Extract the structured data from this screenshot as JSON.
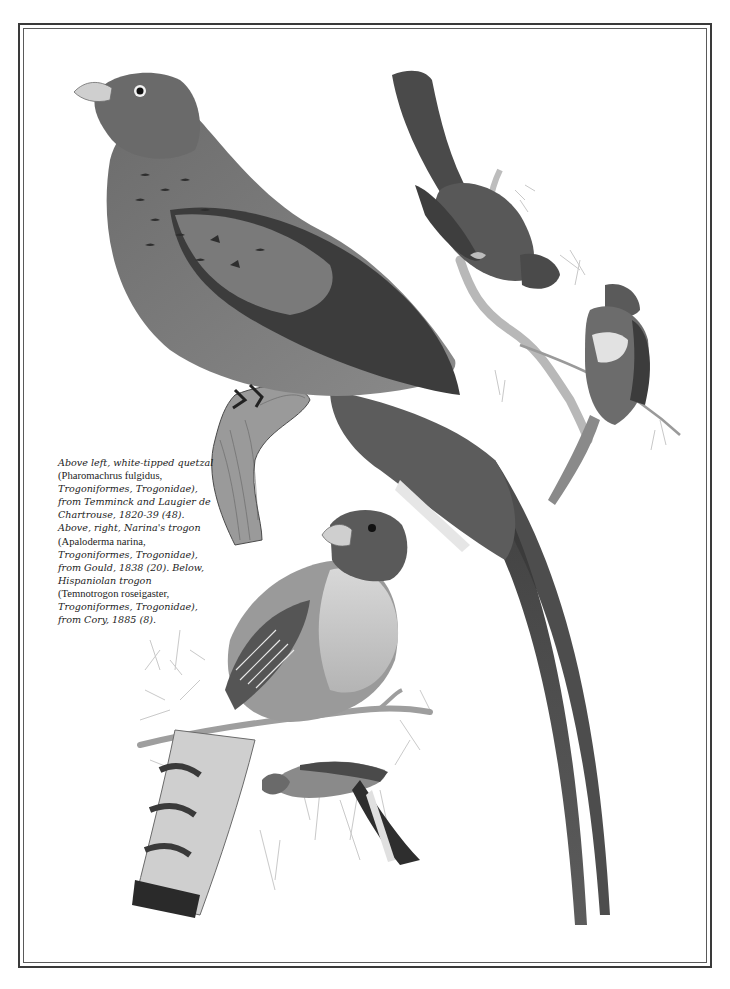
{
  "page": {
    "background": "#ffffff",
    "frame_color": "#3a3a3a"
  },
  "illustrations": [
    {
      "name": "white-tipped quetzal",
      "position": "above left",
      "tone": "#7a7a7a"
    },
    {
      "name": "Narina's trogon (pair)",
      "position": "above right",
      "tone": "#6e6e6e"
    },
    {
      "name": "Hispaniolan trogon (pair)",
      "position": "below",
      "tone": "#8a8a8a"
    }
  ],
  "caption": {
    "lines": [
      {
        "text": "Above left, white-tipped quetzal",
        "style": "it"
      },
      {
        "text": "(Pharomachrus fulgidus,",
        "style": "rm"
      },
      {
        "text": "Trogoniformes, Trogonidae),",
        "style": "it"
      },
      {
        "text": "from Temminck and Laugier de",
        "style": "it"
      },
      {
        "text": "Chartrouse, 1820-39 (48).",
        "style": "it"
      },
      {
        "text": "Above, right, Narina's trogon",
        "style": "it"
      },
      {
        "text": "(Apaloderma narina,",
        "style": "rm"
      },
      {
        "text": "Trogoniformes, Trogonidae),",
        "style": "it"
      },
      {
        "text": "from Gould, 1838 (20). Below,",
        "style": "it"
      },
      {
        "text": "Hispaniolan trogon",
        "style": "it"
      },
      {
        "text": "(Temnotrogon roseigaster,",
        "style": "rm"
      },
      {
        "text": "Trogoniformes, Trogonidae),",
        "style": "it"
      },
      {
        "text": "from Cory, 1885 (8).",
        "style": "it"
      }
    ]
  }
}
